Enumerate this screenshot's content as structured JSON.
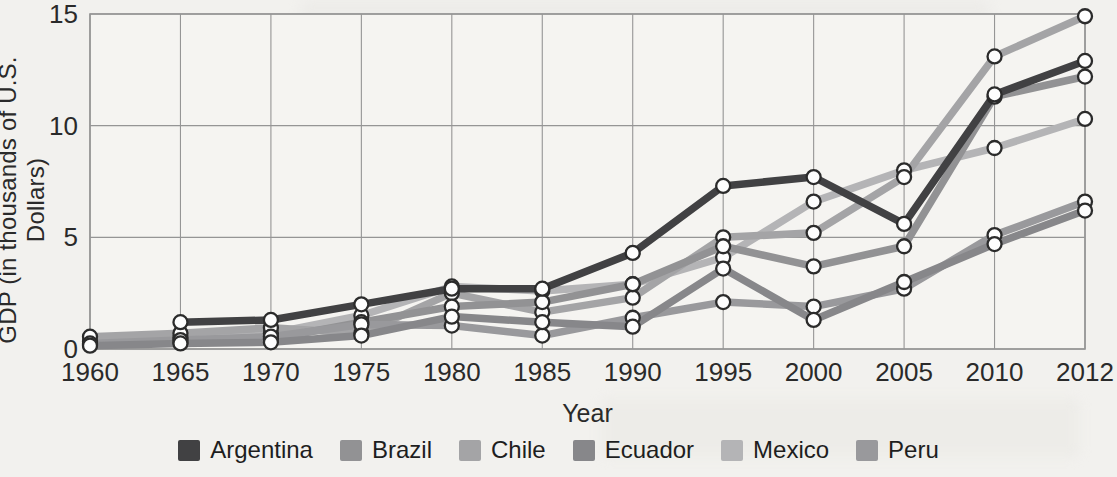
{
  "figure": {
    "y_axis_title": "GDP (in thousands of U.S. Dollars)",
    "x_axis_title": "Year"
  },
  "chart_data": {
    "type": "line",
    "title": "",
    "xlabel": "Year",
    "ylabel": "GDP (in thousands of U.S. Dollars)",
    "x": [
      1960,
      1965,
      1970,
      1975,
      1980,
      1985,
      1990,
      1995,
      2000,
      2005,
      2010,
      2012
    ],
    "ylim": [
      0,
      15
    ],
    "y_ticks": [
      0,
      5,
      10,
      15
    ],
    "grid": true,
    "legend_position": "bottom",
    "marker_style": "white circle with dark ring at every data point",
    "series": [
      {
        "name": "Argentina",
        "color": "#414143",
        "values": [
          null,
          1.2,
          1.3,
          2.0,
          2.7,
          2.7,
          4.3,
          7.3,
          7.7,
          5.6,
          11.4,
          12.9
        ]
      },
      {
        "name": "Brazil",
        "color": "#929294",
        "values": [
          0.2,
          0.3,
          0.45,
          1.2,
          1.9,
          2.1,
          2.9,
          4.6,
          3.7,
          4.6,
          11.3,
          12.2
        ]
      },
      {
        "name": "Chile",
        "color": "#a4a4a6",
        "values": [
          0.55,
          0.7,
          0.95,
          0.7,
          2.5,
          1.65,
          2.3,
          5.0,
          5.2,
          7.7,
          13.1,
          14.9
        ]
      },
      {
        "name": "Ecuador",
        "color": "#87878a",
        "values": [
          0.15,
          0.25,
          0.3,
          0.6,
          1.45,
          1.2,
          1.0,
          3.6,
          1.3,
          3.0,
          4.7,
          6.2
        ]
      },
      {
        "name": "Mexico",
        "color": "#b4b4b6",
        "values": [
          0.35,
          0.5,
          0.7,
          1.5,
          2.8,
          2.6,
          2.9,
          4.1,
          6.6,
          8.0,
          9.0,
          10.3
        ]
      },
      {
        "name": "Peru",
        "color": "#99999c",
        "values": [
          0.25,
          0.4,
          0.55,
          1.1,
          1.05,
          0.6,
          1.4,
          2.1,
          1.9,
          2.7,
          5.1,
          6.6
        ]
      }
    ]
  },
  "style": {
    "page_background": "#f2f1ee",
    "plot_background": "#f5f4f1",
    "grid_color": "#959595",
    "tick_text_color": "#2a2a2a",
    "marker_fill": "#fdfdfd",
    "marker_stroke": "#2b2b2b"
  }
}
